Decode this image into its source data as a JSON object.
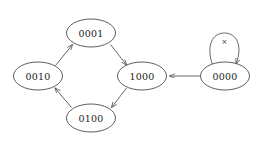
{
  "diagram": {
    "type": "state-transition-graph",
    "background_color": "#ffffff",
    "node_stroke_color": "#4a4a4a",
    "edge_stroke_color": "#555555",
    "label_color": "#1a1a1a",
    "nodes": [
      {
        "id": "n0001",
        "label": "0001",
        "cx": 91,
        "cy": 33,
        "rx": 24.5,
        "ry": 14
      },
      {
        "id": "n0010",
        "label": "0010",
        "cx": 38,
        "cy": 76,
        "rx": 24.5,
        "ry": 14
      },
      {
        "id": "n1000",
        "label": "1000",
        "cx": 142,
        "cy": 76,
        "rx": 24.5,
        "ry": 14
      },
      {
        "id": "n0100",
        "label": "0100",
        "cx": 91,
        "cy": 118,
        "rx": 24.5,
        "ry": 14
      },
      {
        "id": "n0000",
        "label": "0000",
        "cx": 225,
        "cy": 76,
        "rx": 24.5,
        "ry": 14
      }
    ],
    "edges": [
      {
        "id": "e-0010-0001",
        "from": "0010",
        "to": "0001",
        "label": ""
      },
      {
        "id": "e-0001-1000",
        "from": "0001",
        "to": "1000",
        "label": ""
      },
      {
        "id": "e-1000-0100",
        "from": "1000",
        "to": "0100",
        "label": ""
      },
      {
        "id": "e-0100-0010",
        "from": "0100",
        "to": "0010",
        "label": ""
      },
      {
        "id": "e-0000-1000",
        "from": "0000",
        "to": "1000",
        "label": ""
      },
      {
        "id": "e-0000-0000",
        "from": "0000",
        "to": "0000",
        "label": "×"
      }
    ],
    "self_loop_label": "×"
  }
}
